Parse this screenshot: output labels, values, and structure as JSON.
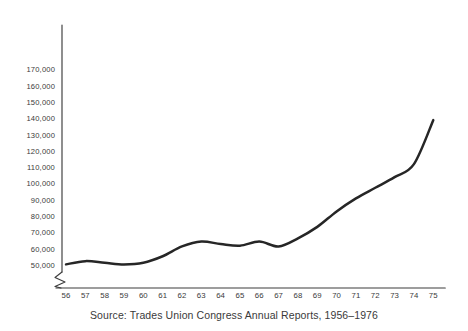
{
  "caption": "Source: Trades Union Congress Annual Reports, 1956–1976",
  "colors": {
    "curve": "#262626",
    "axis": "#3c3c3c",
    "text": "#3a3a3a",
    "background": "#ffffff"
  },
  "chart_data": {
    "type": "line",
    "title": "",
    "subtitle": "",
    "xlabel": "",
    "ylabel": "",
    "caption": "Source: Trades Union Congress Annual Reports, 1956–1976",
    "grid": false,
    "legend": false,
    "legend_position": "none",
    "axis_break": true,
    "axis_break_note": "y-axis broken between 0 and 50,000",
    "xlim": [
      1956,
      1975
    ],
    "ylim": [
      45000,
      175000
    ],
    "ytick_labels": [
      "170,000",
      "160,000",
      "150,000",
      "140,000",
      "130,000",
      "120,000",
      "110,000",
      "100,000",
      "90,000",
      "80,000",
      "70,000",
      "60,000",
      "50,000"
    ],
    "yticks": [
      170000,
      160000,
      150000,
      140000,
      130000,
      120000,
      110000,
      100000,
      90000,
      80000,
      70000,
      60000,
      50000
    ],
    "xtick_labels": [
      "56",
      "57",
      "58",
      "59",
      "60",
      "61",
      "62",
      "63",
      "64",
      "65",
      "66",
      "67",
      "68",
      "69",
      "70",
      "71",
      "72",
      "73",
      "74",
      "75"
    ],
    "x": [
      1956,
      1957,
      1958,
      1959,
      1960,
      1961,
      1962,
      1963,
      1964,
      1965,
      1966,
      1967,
      1968,
      1969,
      1970,
      1971,
      1972,
      1973,
      1974,
      1975
    ],
    "categories": [
      "56",
      "57",
      "58",
      "59",
      "60",
      "61",
      "62",
      "63",
      "64",
      "65",
      "66",
      "67",
      "68",
      "69",
      "70",
      "71",
      "72",
      "73",
      "74",
      "75"
    ],
    "values": [
      50500,
      52500,
      51500,
      50500,
      51500,
      55500,
      61500,
      64500,
      63000,
      62000,
      64500,
      61500,
      66500,
      73500,
      83000,
      91000,
      97500,
      104000,
      112000,
      139000
    ],
    "series": [
      {
        "name": "Membership",
        "values": [
          50500,
          52500,
          51500,
          50500,
          51500,
          55500,
          61500,
          64500,
          63000,
          62000,
          64500,
          61500,
          66500,
          73500,
          83000,
          91000,
          97500,
          104000,
          112000,
          139000
        ]
      }
    ]
  }
}
